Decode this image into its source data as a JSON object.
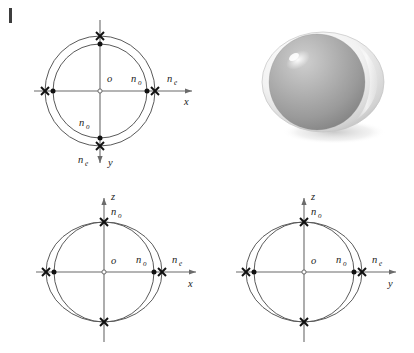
{
  "figure": {
    "background_color": "#ffffff",
    "ink_color": "#1a1a1a",
    "axis_color": "#6b6b6b",
    "curve_color": "#5a5a5a",
    "marker_dot_color": "#111111",
    "marker_x_color": "#111111"
  },
  "labels": {
    "origin": "o",
    "n_ordinary": "n",
    "n_ordinary_sub": "o",
    "n_extraordinary": "n",
    "n_extraordinary_sub": "e",
    "axis_x": "x",
    "axis_y": "y",
    "axis_z": "z"
  },
  "panels": [
    {
      "id": "panel-xy",
      "name": "xy-section",
      "position": "top-left",
      "axis_horizontal": "x",
      "axis_vertical": "y",
      "vertical_axis_points_down": true,
      "curves": [
        {
          "kind": "circle",
          "label": "n_o",
          "radius_px": 47,
          "marker": "dot"
        },
        {
          "kind": "circle",
          "label": "n_e",
          "radius_px": 55,
          "marker": "cross"
        }
      ],
      "annotations": [
        {
          "text": "o",
          "role": "origin"
        },
        {
          "text": "n_o",
          "role": "inner-radius-right"
        },
        {
          "text": "n_e",
          "role": "outer-radius-right"
        },
        {
          "text": "n_o",
          "role": "inner-radius-down"
        },
        {
          "text": "n_e",
          "role": "outer-radius-down"
        }
      ]
    },
    {
      "id": "panel-ellipsoid",
      "name": "indicatrix-3d",
      "position": "top-right",
      "description": "Shaded three-dimensional ellipsoid of revolution with inner sphere",
      "shape": "oblate-ellipsoid-with-sphere",
      "highlight": true,
      "shadow": true
    },
    {
      "id": "panel-xz",
      "name": "xz-section",
      "position": "bottom-left",
      "axis_horizontal": "x",
      "axis_vertical": "z",
      "vertical_axis_points_down": false,
      "curves": [
        {
          "kind": "circle",
          "label": "n_o",
          "radius_px": 50,
          "marker": "dot"
        },
        {
          "kind": "ellipse",
          "label": "n_e",
          "rx_px": 58,
          "ry_px": 50,
          "marker": "cross"
        }
      ],
      "annotations": [
        {
          "text": "o",
          "role": "origin"
        },
        {
          "text": "n_o",
          "role": "inner-radius-right"
        },
        {
          "text": "n_e",
          "role": "outer-radius-right"
        },
        {
          "text": "n_o",
          "role": "vertical-radius-up"
        }
      ]
    },
    {
      "id": "panel-yz",
      "name": "yz-section",
      "position": "bottom-right",
      "axis_horizontal": "y",
      "axis_vertical": "z",
      "vertical_axis_points_down": false,
      "curves": [
        {
          "kind": "circle",
          "label": "n_o",
          "radius_px": 50,
          "marker": "dot"
        },
        {
          "kind": "ellipse",
          "label": "n_e",
          "rx_px": 58,
          "ry_px": 50,
          "marker": "cross"
        }
      ],
      "annotations": [
        {
          "text": "o",
          "role": "origin"
        },
        {
          "text": "n_o",
          "role": "inner-radius-right"
        },
        {
          "text": "n_e",
          "role": "outer-radius-right"
        },
        {
          "text": "n_o",
          "role": "vertical-radius-up"
        }
      ]
    }
  ]
}
